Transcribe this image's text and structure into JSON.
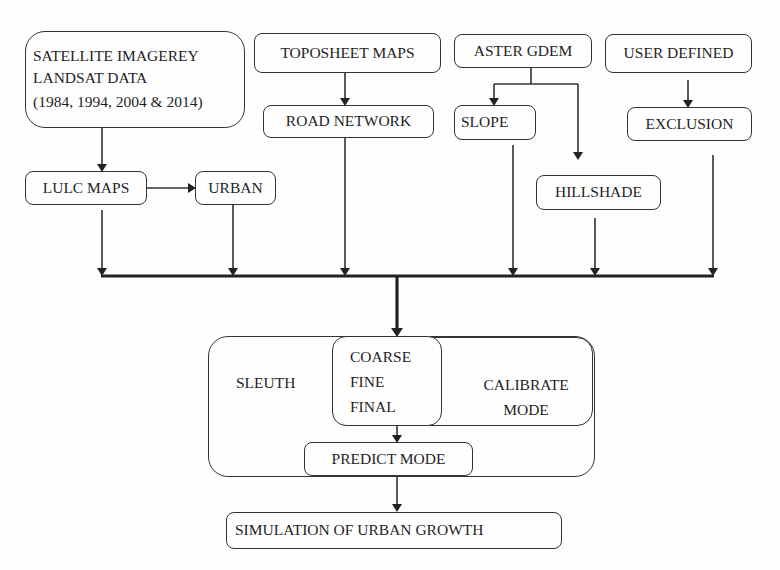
{
  "diagram": {
    "inputs": {
      "satellite": {
        "line1": "SATELLITE IMAGEREY",
        "line2": "LANDSAT DATA",
        "line3": "(1984, 1994, 2004 & 2014)"
      },
      "toposheet": "TOPOSHEET MAPS",
      "aster": "ASTER GDEM",
      "user_defined": "USER DEFINED"
    },
    "derived": {
      "lulc": "LULC MAPS",
      "urban": "URBAN",
      "road": "ROAD NETWORK",
      "slope": "SLOPE",
      "hillshade": "HILLSHADE",
      "exclusion": "EXCLUSION"
    },
    "model": {
      "sleuth": "SLEUTH",
      "phases": [
        "COARSE",
        "FINE",
        "FINAL"
      ],
      "calibrate_line1": "CALIBRATE",
      "calibrate_line2": "MODE",
      "predict": "PREDICT MODE"
    },
    "output": "SIMULATION OF URBAN GROWTH",
    "colors": {
      "stroke": "#333333",
      "text": "#1e1e1e",
      "background": "#fefefe"
    }
  }
}
